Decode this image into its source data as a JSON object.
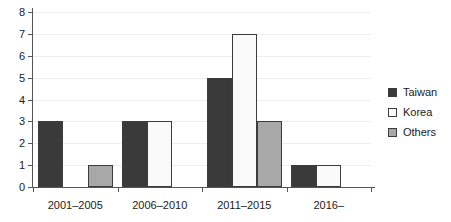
{
  "chart_data": {
    "type": "bar",
    "title": "",
    "subtitle": "",
    "xlabel": "",
    "ylabel": "",
    "categories": [
      "2001–2005",
      "2006–2010",
      "2011–2015",
      "2016–"
    ],
    "series": [
      {
        "name": "Taiwan",
        "values": [
          3,
          3,
          5,
          1
        ],
        "color": "#3a3a3a"
      },
      {
        "name": "Korea",
        "values": [
          0,
          3,
          7,
          1
        ],
        "color": "#fafafa"
      },
      {
        "name": "Others",
        "values": [
          1,
          0,
          3,
          0
        ],
        "color": "#a8a8a8"
      }
    ],
    "ylim": [
      0,
      8
    ],
    "y_ticks": [
      0,
      1,
      2,
      3,
      4,
      5,
      6,
      7,
      8
    ],
    "y_tick_labels": [
      "0",
      "1",
      "2",
      "3",
      "4",
      "5",
      "6",
      "7",
      "8"
    ],
    "grid": true,
    "grid_axis": "y",
    "legend_position": "right",
    "legend_entries": [
      "Taiwan",
      "Korea",
      "Others"
    ],
    "annotations": [],
    "grouping": "grouped",
    "bar_border_color": "#3c3c3c",
    "gridline_color": "#ededed",
    "axis_color": "#555555"
  }
}
